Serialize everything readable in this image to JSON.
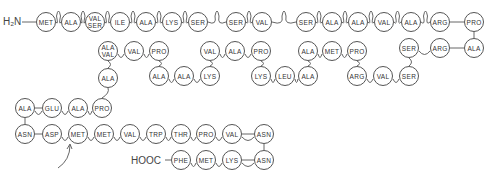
{
  "diagram": {
    "n_terminus": "H₂N",
    "c_terminus": "HOOC",
    "residues": [
      {
        "id": "r1",
        "label": "MET",
        "x": 46,
        "y": 22
      },
      {
        "id": "r2",
        "label": "ALA",
        "x": 71,
        "y": 22
      },
      {
        "id": "r3",
        "label": "VAL",
        "label2": "SER",
        "x": 95,
        "y": 22
      },
      {
        "id": "r4",
        "label": "ILE",
        "x": 120,
        "y": 22
      },
      {
        "id": "r5",
        "label": "ALA",
        "x": 146,
        "y": 22
      },
      {
        "id": "r6",
        "label": "LYS",
        "x": 172,
        "y": 22
      },
      {
        "id": "r7",
        "label": "SER",
        "x": 198,
        "y": 22
      },
      {
        "id": "r8",
        "label": "SER",
        "x": 236,
        "y": 22
      },
      {
        "id": "r9",
        "label": "VAL",
        "x": 262,
        "y": 22
      },
      {
        "id": "r10",
        "label": "SER",
        "x": 306,
        "y": 22
      },
      {
        "id": "r11",
        "label": "ALA",
        "x": 332,
        "y": 22
      },
      {
        "id": "r12",
        "label": "ALA",
        "x": 358,
        "y": 22
      },
      {
        "id": "r13",
        "label": "VAL",
        "x": 384,
        "y": 22
      },
      {
        "id": "r14",
        "label": "ALA",
        "x": 411,
        "y": 22
      },
      {
        "id": "r15",
        "label": "ARG",
        "x": 440,
        "y": 22
      },
      {
        "id": "r16",
        "label": "PRO",
        "x": 474,
        "y": 22
      },
      {
        "id": "r17",
        "label": "ALA",
        "x": 474,
        "y": 48
      },
      {
        "id": "r18",
        "label": "ARG",
        "x": 440,
        "y": 48
      },
      {
        "id": "r19",
        "label": "SER",
        "x": 409,
        "y": 48
      },
      {
        "id": "r20",
        "label": "SER",
        "x": 409,
        "y": 76
      },
      {
        "id": "r21",
        "label": "VAL",
        "x": 383,
        "y": 76
      },
      {
        "id": "r22",
        "label": "ARG",
        "x": 357,
        "y": 76
      },
      {
        "id": "r23",
        "label": "PRO",
        "x": 357,
        "y": 51
      },
      {
        "id": "r24",
        "label": "MET",
        "x": 332,
        "y": 51
      },
      {
        "id": "r25",
        "label": "ALA",
        "x": 308,
        "y": 51
      },
      {
        "id": "r26",
        "label": "ALA",
        "x": 308,
        "y": 76
      },
      {
        "id": "r27",
        "label": "LEU",
        "x": 285,
        "y": 76
      },
      {
        "id": "r28",
        "label": "LYS",
        "x": 261,
        "y": 76
      },
      {
        "id": "r29",
        "label": "PRO",
        "x": 261,
        "y": 51
      },
      {
        "id": "r30",
        "label": "ALA",
        "x": 235,
        "y": 51
      },
      {
        "id": "r31",
        "label": "VAL",
        "x": 210,
        "y": 51
      },
      {
        "id": "r32",
        "label": "LYS",
        "x": 210,
        "y": 76
      },
      {
        "id": "r33",
        "label": "ALA",
        "x": 184,
        "y": 76
      },
      {
        "id": "r34",
        "label": "ALA",
        "x": 159,
        "y": 76
      },
      {
        "id": "r35",
        "label": "PRO",
        "x": 159,
        "y": 51
      },
      {
        "id": "r36",
        "label": "VAL",
        "x": 134,
        "y": 51
      },
      {
        "id": "r37",
        "label": "ALA",
        "label2": "VAL",
        "x": 108,
        "y": 51
      },
      {
        "id": "r38",
        "label": "ALA",
        "x": 108,
        "y": 78
      },
      {
        "id": "r39",
        "label": "PRO",
        "x": 102,
        "y": 108
      },
      {
        "id": "r40",
        "label": "ALA",
        "x": 78,
        "y": 108
      },
      {
        "id": "r41",
        "label": "GLU",
        "x": 52,
        "y": 108
      },
      {
        "id": "r42",
        "label": "ALA",
        "x": 25,
        "y": 108
      },
      {
        "id": "r43",
        "label": "ASN",
        "x": 25,
        "y": 134
      },
      {
        "id": "r44",
        "label": "ASP",
        "x": 52,
        "y": 134
      },
      {
        "id": "r45",
        "label": "MET",
        "x": 78,
        "y": 134
      },
      {
        "id": "r46",
        "label": "MET",
        "x": 104,
        "y": 134
      },
      {
        "id": "r47",
        "label": "VAL",
        "x": 130,
        "y": 134
      },
      {
        "id": "r48",
        "label": "TRP",
        "x": 156,
        "y": 134
      },
      {
        "id": "r49",
        "label": "THR",
        "x": 181,
        "y": 134
      },
      {
        "id": "r50",
        "label": "PRO",
        "x": 206,
        "y": 134
      },
      {
        "id": "r51",
        "label": "VAL",
        "x": 232,
        "y": 134
      },
      {
        "id": "r52",
        "label": "ASN",
        "x": 264,
        "y": 134
      },
      {
        "id": "r53",
        "label": "ASN",
        "x": 264,
        "y": 160
      },
      {
        "id": "r54",
        "label": "LYS",
        "x": 232,
        "y": 160
      },
      {
        "id": "r55",
        "label": "MET",
        "x": 206,
        "y": 160
      },
      {
        "id": "r56",
        "label": "PHE",
        "x": 181,
        "y": 160
      }
    ]
  }
}
